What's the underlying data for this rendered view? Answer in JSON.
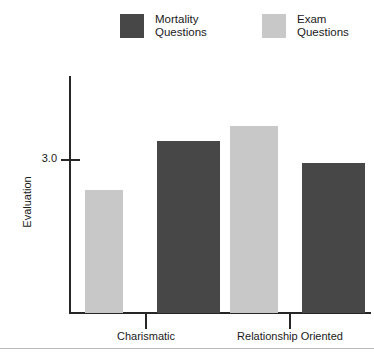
{
  "chart_data": {
    "type": "bar",
    "title": "",
    "xlabel": "",
    "ylabel": "Evaluation",
    "categories": [
      "Charismatic",
      "Relationship Oriented"
    ],
    "series": [
      {
        "name": "Mortality Questions",
        "color": "#474747",
        "values": [
          3.38,
          2.94
        ]
      },
      {
        "name": "Exam Questions",
        "color": "#c8c8c8",
        "values": [
          2.62,
          3.67
        ]
      }
    ],
    "bars": [
      {
        "group": "Charismatic",
        "series": "Exam Questions",
        "value": 2.62,
        "color": "#c8c8c8",
        "left": 85,
        "width": 38,
        "top": 190
      },
      {
        "group": "Charismatic",
        "series": "Mortality Questions",
        "value": 3.38,
        "color": "#474747",
        "left": 157,
        "width": 63,
        "top": 141
      },
      {
        "group": "Relationship Oriented",
        "series": "Exam Questions",
        "value": 3.67,
        "color": "#c8c8c8",
        "left": 230,
        "width": 48,
        "top": 126
      },
      {
        "group": "Relationship Oriented",
        "series": "Mortality Questions",
        "value": 2.94,
        "color": "#474747",
        "left": 302,
        "width": 63,
        "top": 163
      }
    ],
    "ytick_labels": [
      "3.0"
    ],
    "ytick_values": [
      3.0
    ],
    "ylim": [
      2.0,
      4.0
    ],
    "grid": false,
    "legend_position": "top",
    "axis_color": "#262626"
  },
  "legend": {
    "entries": [
      {
        "label": "Mortality\nQuestions",
        "color": "#474747"
      },
      {
        "label": "Exam\nQuestions",
        "color": "#c8c8c8"
      }
    ]
  },
  "axis": {
    "ytick_label_0": "3.0",
    "ylabel": "Evaluation",
    "xlabel_0": "Charismatic",
    "xlabel_1": "Relationship Oriented"
  }
}
